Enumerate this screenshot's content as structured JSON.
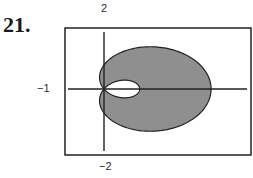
{
  "exercise_number": "21.",
  "chart_data": {
    "type": "line",
    "subtype": "polar-filled-region",
    "title": "",
    "equation_hint": "limaçon with inner loop, r = 1 + 2cos(theta)",
    "labels": {
      "y_top": "2",
      "y_bottom": "-2",
      "x_left": "-1"
    },
    "xlim": [
      -1,
      4
    ],
    "ylim": [
      -2,
      2
    ],
    "fill_color": "#8f8f8f",
    "inner_loop_fill": "#ffffff",
    "grid": false,
    "legend": null
  },
  "axis_labels": {
    "top": "2",
    "bottom": "−2",
    "left": "−1"
  }
}
